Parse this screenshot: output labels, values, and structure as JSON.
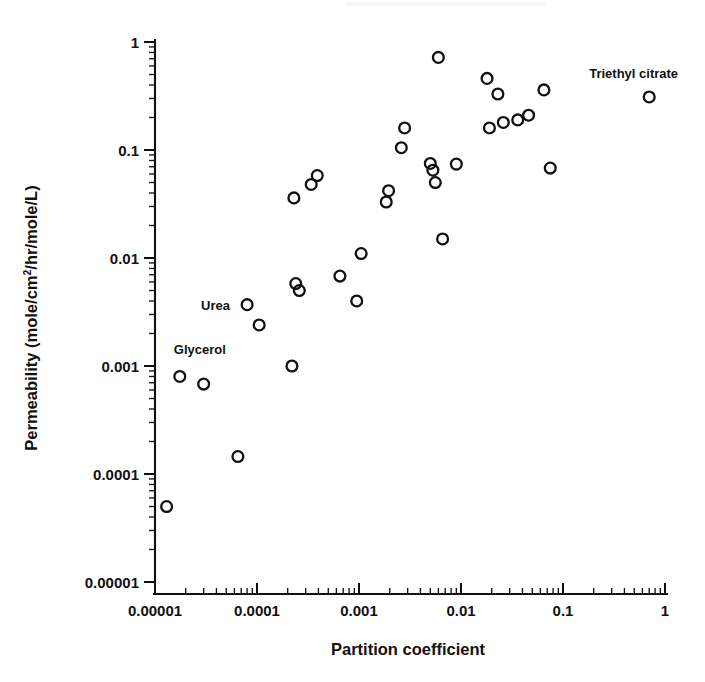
{
  "figure": {
    "background": "#ffffff",
    "ink_color": "#111111",
    "marker_shape": "open-circle"
  },
  "chart_data": {
    "type": "scatter",
    "title": "",
    "xlabel": "Partition coefficient",
    "ylabel": "Permeability (mole/cm2/hr/mole/L)",
    "ylabel_base": "Permeability (mole/cm",
    "ylabel_sup": "2",
    "ylabel_tail": "/hr/mole/L)",
    "xscale": "log",
    "yscale": "log",
    "xlim": [
      1e-05,
      1
    ],
    "ylim": [
      1e-05,
      1
    ],
    "grid": false,
    "legend": "none",
    "xticklabels": [
      "0.00001",
      "0.0001",
      "0.001",
      "0.01",
      "0.1",
      "1"
    ],
    "xtickvalues": [
      1e-05,
      0.0001,
      0.001,
      0.01,
      0.1,
      1
    ],
    "yticklabels": [
      "1",
      "0.1",
      "0.01",
      "0.001",
      "0.0001",
      "0.00001"
    ],
    "ytickvalues": [
      1,
      0.1,
      0.01,
      0.001,
      0.0001,
      1e-05
    ],
    "minor_ticks": true,
    "points": [
      {
        "x": 1.3e-05,
        "y": 5e-05
      },
      {
        "x": 1.75e-05,
        "y": 0.0008,
        "label": "Glycerol"
      },
      {
        "x": 3e-05,
        "y": 0.00068
      },
      {
        "x": 6.5e-05,
        "y": 0.000145
      },
      {
        "x": 8e-05,
        "y": 0.0037,
        "label": "Urea"
      },
      {
        "x": 0.000105,
        "y": 0.0024
      },
      {
        "x": 0.00022,
        "y": 0.001
      },
      {
        "x": 0.00024,
        "y": 0.0058
      },
      {
        "x": 0.00026,
        "y": 0.005
      },
      {
        "x": 0.00023,
        "y": 0.036
      },
      {
        "x": 0.00034,
        "y": 0.048
      },
      {
        "x": 0.00039,
        "y": 0.058
      },
      {
        "x": 0.00065,
        "y": 0.0068
      },
      {
        "x": 0.00095,
        "y": 0.004
      },
      {
        "x": 0.00105,
        "y": 0.011
      },
      {
        "x": 0.00185,
        "y": 0.033
      },
      {
        "x": 0.00195,
        "y": 0.042
      },
      {
        "x": 0.0026,
        "y": 0.105
      },
      {
        "x": 0.0028,
        "y": 0.16
      },
      {
        "x": 0.005,
        "y": 0.075
      },
      {
        "x": 0.0053,
        "y": 0.065
      },
      {
        "x": 0.0056,
        "y": 0.05
      },
      {
        "x": 0.006,
        "y": 0.72
      },
      {
        "x": 0.0066,
        "y": 0.015
      },
      {
        "x": 0.009,
        "y": 0.074
      },
      {
        "x": 0.018,
        "y": 0.46
      },
      {
        "x": 0.019,
        "y": 0.16
      },
      {
        "x": 0.023,
        "y": 0.33
      },
      {
        "x": 0.026,
        "y": 0.18
      },
      {
        "x": 0.036,
        "y": 0.19
      },
      {
        "x": 0.046,
        "y": 0.21
      },
      {
        "x": 0.065,
        "y": 0.36
      },
      {
        "x": 0.075,
        "y": 0.068
      },
      {
        "x": 0.7,
        "y": 0.31,
        "label": "Triethyl citrate"
      }
    ],
    "annotations": [
      {
        "text": "Glycerol",
        "anchor_x": 1.75e-05,
        "anchor_y": 0.0008,
        "dx": -6,
        "dy": -22,
        "align": "start"
      },
      {
        "text": "Urea",
        "anchor_x": 8e-05,
        "anchor_y": 0.0037,
        "dx": -46,
        "dy": 5,
        "align": "start"
      },
      {
        "text": "Triethyl citrate",
        "anchor_x": 0.7,
        "anchor_y": 0.31,
        "dx": -60,
        "dy": -19,
        "align": "start"
      }
    ]
  }
}
